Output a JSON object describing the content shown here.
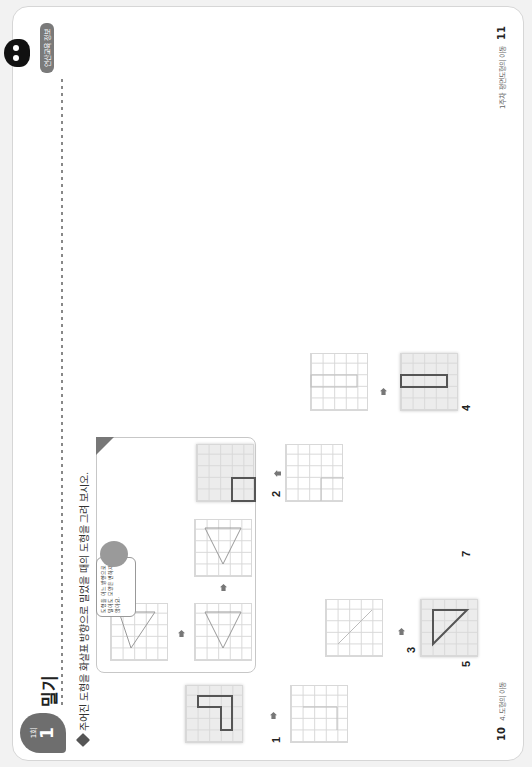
{
  "header": {
    "badge_small": "1회",
    "badge_number": "1",
    "title": "밀기",
    "tag": "연산교육 정보",
    "instruction": "주어진 도형을 화살표 방향으로 밀었을 때의 도형을 그려 보시오."
  },
  "example": {
    "speech_bubble": "도형을 어느 방향으로 밀어도 모양은 변하지 않아요."
  },
  "problems": [
    {
      "number": "1",
      "label": "1"
    },
    {
      "number": "2",
      "label": "2"
    },
    {
      "number": "3",
      "label": "3"
    },
    {
      "number": "4",
      "label": "4"
    },
    {
      "number": "5",
      "label": "5"
    },
    {
      "number": "6",
      "label": "6"
    },
    {
      "number": "7",
      "label": "7"
    },
    {
      "number": "8",
      "label": "8"
    },
    {
      "number": "9",
      "label": "9"
    }
  ],
  "footer": {
    "left_page": "10",
    "left_text": "4.도형의 이동",
    "right_page": "11",
    "right_text": "1주차 평면도형의 이동"
  },
  "colors": {
    "shape_stroke": "#555555",
    "light_stroke": "#bdbdbd",
    "shaded_grid": "#ececec",
    "badge": "#6e6e6e"
  }
}
